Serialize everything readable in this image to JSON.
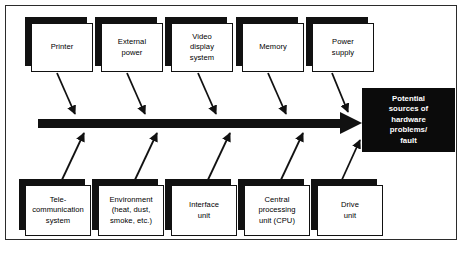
{
  "diagram": {
    "type": "fishbone-ishikawa",
    "effect": {
      "text": "Potential\nsources of\nhardware\nproblems/\nfault",
      "fill": "#0b0b0b",
      "text_color": "#ffffff"
    },
    "spine": {
      "label": "main-spine-arrow",
      "color": "#111111"
    },
    "causes_top": [
      {
        "id": "printer",
        "label": "Printer"
      },
      {
        "id": "external-power",
        "label": "External\npower"
      },
      {
        "id": "video-display-system",
        "label": "Video\ndisplay\nsystem"
      },
      {
        "id": "memory",
        "label": "Memory"
      },
      {
        "id": "power-supply",
        "label": "Power\nsupply"
      }
    ],
    "causes_bottom": [
      {
        "id": "telecommunication-system",
        "label": "Tele-\ncommunication\nsystem"
      },
      {
        "id": "environment",
        "label": "Environment\n(heat, dust,\nsmoke, etc.)"
      },
      {
        "id": "interface-unit",
        "label": "Interface\nunit"
      },
      {
        "id": "central-processing-unit",
        "label": "Central\nprocessing\nunit (CPU)"
      },
      {
        "id": "drive-unit",
        "label": "Drive\nunit"
      }
    ]
  }
}
